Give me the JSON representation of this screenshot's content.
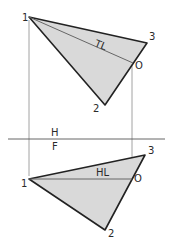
{
  "diagram": {
    "colors": {
      "fill": "#d9d9d9",
      "edge": "#222222",
      "construction": "#8a8a8a"
    },
    "top_view": {
      "view_label": "H",
      "vertices": [
        {
          "id": "1",
          "label": "1",
          "x": 29,
          "y": 17
        },
        {
          "id": "2",
          "label": "2",
          "x": 105,
          "y": 105
        },
        {
          "id": "3",
          "label": "3",
          "x": 147,
          "y": 43
        }
      ],
      "point_o": {
        "label": "O",
        "x": 133,
        "y": 63
      },
      "line_label": "TL"
    },
    "front_view": {
      "view_label": "F",
      "vertices": [
        {
          "id": "1",
          "label": "1",
          "x": 29,
          "y": 179
        },
        {
          "id": "2",
          "label": "2",
          "x": 105,
          "y": 230
        },
        {
          "id": "3",
          "label": "3",
          "x": 145,
          "y": 155
        }
      ],
      "point_o": {
        "label": "O",
        "x": 132,
        "y": 179
      },
      "line_label": "HL"
    },
    "fold_line": {
      "label_above": "H",
      "label_below": "F",
      "y": 139
    }
  }
}
